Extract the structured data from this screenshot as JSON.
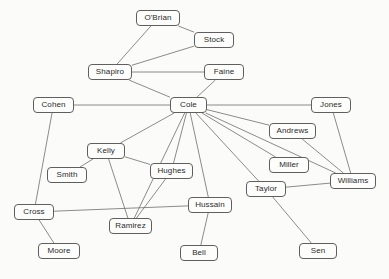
{
  "diagram": {
    "type": "node-link-network",
    "title": "",
    "background_color": "#fbfbf9",
    "node_border_color": "#5f5f5f",
    "node_fill_color": "#fdfdfc",
    "edge_color": "#6e6e6e",
    "label_color": "#2b2b2b",
    "node_count": 20,
    "edge_count": 27,
    "nodes": [
      {
        "id": "obrian",
        "label": "O'Brian",
        "x": 136,
        "y": 10,
        "w": 44,
        "h": 16
      },
      {
        "id": "stock",
        "label": "Stock",
        "x": 194,
        "y": 32,
        "w": 40,
        "h": 16
      },
      {
        "id": "shapiro",
        "label": "Shapiro",
        "x": 88,
        "y": 64,
        "w": 44,
        "h": 16
      },
      {
        "id": "faine",
        "label": "Faine",
        "x": 204,
        "y": 64,
        "w": 40,
        "h": 16
      },
      {
        "id": "cohen",
        "label": "Cohen",
        "x": 33,
        "y": 97,
        "w": 41,
        "h": 16
      },
      {
        "id": "cole",
        "label": "Cole",
        "x": 170,
        "y": 97,
        "w": 37,
        "h": 16
      },
      {
        "id": "jones",
        "label": "Jones",
        "x": 311,
        "y": 97,
        "w": 40,
        "h": 16
      },
      {
        "id": "andrews",
        "label": "Andrews",
        "x": 269,
        "y": 123,
        "w": 47,
        "h": 16
      },
      {
        "id": "kelly",
        "label": "Kelly",
        "x": 87,
        "y": 143,
        "w": 38,
        "h": 16
      },
      {
        "id": "miller",
        "label": "Miller",
        "x": 269,
        "y": 157,
        "w": 40,
        "h": 16
      },
      {
        "id": "smith",
        "label": "Smith",
        "x": 47,
        "y": 167,
        "w": 40,
        "h": 16
      },
      {
        "id": "hughes",
        "label": "Hughes",
        "x": 150,
        "y": 163,
        "w": 43,
        "h": 16
      },
      {
        "id": "williams",
        "label": "Williams",
        "x": 330,
        "y": 173,
        "w": 46,
        "h": 16
      },
      {
        "id": "taylor",
        "label": "Taylor",
        "x": 246,
        "y": 181,
        "w": 40,
        "h": 16
      },
      {
        "id": "hussain",
        "label": "Hussain",
        "x": 188,
        "y": 197,
        "w": 44,
        "h": 16
      },
      {
        "id": "cross",
        "label": "Cross",
        "x": 14,
        "y": 204,
        "w": 40,
        "h": 16
      },
      {
        "id": "ramirez",
        "label": "Ramirez",
        "x": 109,
        "y": 218,
        "w": 43,
        "h": 16
      },
      {
        "id": "moore",
        "label": "Moore",
        "x": 38,
        "y": 243,
        "w": 42,
        "h": 16
      },
      {
        "id": "bell",
        "label": "Bell",
        "x": 180,
        "y": 245,
        "w": 38,
        "h": 16
      },
      {
        "id": "sen",
        "label": "Sen",
        "x": 299,
        "y": 243,
        "w": 38,
        "h": 16
      }
    ],
    "edges": [
      {
        "source": "obrian",
        "target": "shapiro"
      },
      {
        "source": "obrian",
        "target": "stock"
      },
      {
        "source": "stock",
        "target": "shapiro"
      },
      {
        "source": "shapiro",
        "target": "faine"
      },
      {
        "source": "shapiro",
        "target": "cole"
      },
      {
        "source": "faine",
        "target": "cole"
      },
      {
        "source": "cohen",
        "target": "cole"
      },
      {
        "source": "cohen",
        "target": "cross"
      },
      {
        "source": "cole",
        "target": "jones"
      },
      {
        "source": "cole",
        "target": "andrews"
      },
      {
        "source": "cole",
        "target": "kelly"
      },
      {
        "source": "cole",
        "target": "miller"
      },
      {
        "source": "cole",
        "target": "hughes"
      },
      {
        "source": "cole",
        "target": "hussain"
      },
      {
        "source": "cole",
        "target": "taylor"
      },
      {
        "source": "cole",
        "target": "williams"
      },
      {
        "source": "cole",
        "target": "ramirez"
      },
      {
        "source": "jones",
        "target": "williams"
      },
      {
        "source": "andrews",
        "target": "williams"
      },
      {
        "source": "kelly",
        "target": "smith"
      },
      {
        "source": "kelly",
        "target": "hughes"
      },
      {
        "source": "kelly",
        "target": "ramirez"
      },
      {
        "source": "hughes",
        "target": "ramirez"
      },
      {
        "source": "hussain",
        "target": "cross"
      },
      {
        "source": "hussain",
        "target": "bell"
      },
      {
        "source": "taylor",
        "target": "williams"
      },
      {
        "source": "taylor",
        "target": "sen"
      },
      {
        "source": "cross",
        "target": "moore"
      }
    ]
  }
}
